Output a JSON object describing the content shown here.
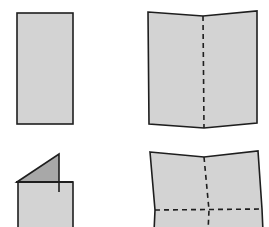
{
  "diagram": {
    "title": "",
    "colors": {
      "background": "#ffffff",
      "paper_fill": "#d3d3d3",
      "folded_flap_fill": "#a8a8a8",
      "stroke": "#1e1e1e"
    },
    "panels": [
      {
        "id": "step-1",
        "label": "flat narrow sheet",
        "position": "top-left"
      },
      {
        "id": "step-2",
        "label": "sheet with vertical center fold (dashed)",
        "position": "top-right"
      },
      {
        "id": "step-3",
        "label": "sheet with corner folded up (triangular flap)",
        "position": "bottom-left"
      },
      {
        "id": "step-4",
        "label": "sheet with vertical and horizontal fold lines (dashed)",
        "position": "bottom-right"
      }
    ]
  }
}
